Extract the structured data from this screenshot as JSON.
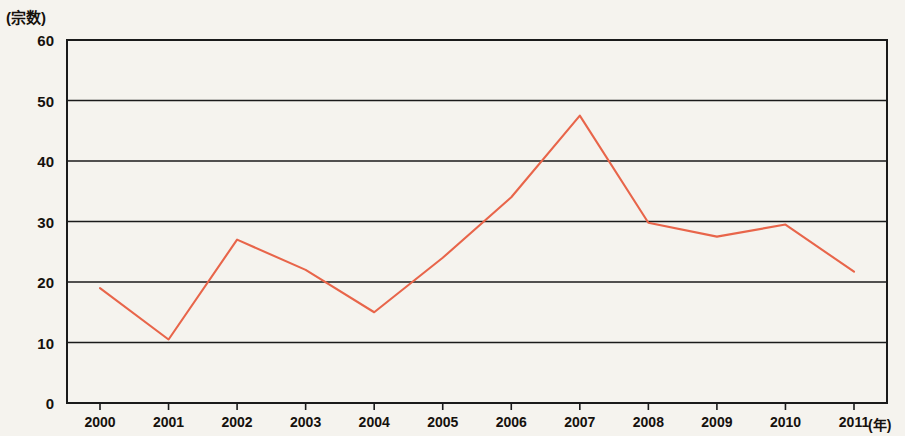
{
  "chart_data": {
    "type": "line",
    "title": "",
    "subtitle": "",
    "xlabel": "(年)",
    "ylabel": "(宗数)",
    "categories": [
      "2000",
      "2001",
      "2002",
      "2003",
      "2004",
      "2005",
      "2006",
      "2007",
      "2008",
      "2009",
      "2010",
      "2011"
    ],
    "x": [
      2000,
      2001,
      2002,
      2003,
      2004,
      2005,
      2006,
      2007,
      2008,
      2009,
      2010,
      2011
    ],
    "values": [
      19,
      10.5,
      27,
      22,
      15,
      24,
      34,
      47.5,
      29.8,
      27.5,
      29.5,
      21.7
    ],
    "series": [
      {
        "name": "宗数",
        "color": "#e8654a",
        "values": [
          19,
          10.5,
          27,
          22,
          15,
          24,
          34,
          47.5,
          29.8,
          27.5,
          29.5,
          21.7
        ]
      }
    ],
    "ylim": [
      0,
      60
    ],
    "yticks": [
      0,
      10,
      20,
      30,
      40,
      50,
      60
    ],
    "ytick_labels": [
      "0",
      "10",
      "20",
      "30",
      "40",
      "50",
      "60"
    ],
    "xtick_labels": [
      "2000",
      "2001",
      "2002",
      "2003",
      "2004",
      "2005",
      "2006",
      "2007",
      "2008",
      "2009",
      "2010",
      "2011"
    ],
    "grid": true,
    "grid_axis": "y",
    "legend": false,
    "legend_position": "none",
    "markers": false,
    "line_color": "#e8654a",
    "axis_color": "#1a1a1a",
    "background_color": "#f5f3ee",
    "annotations": []
  },
  "axes": {
    "y_unit_label": "(宗数)",
    "x_unit_label": "(年)"
  }
}
